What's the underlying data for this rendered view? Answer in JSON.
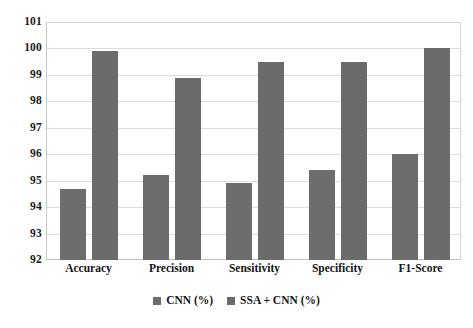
{
  "chart_data": {
    "type": "bar",
    "title": "",
    "xlabel": "",
    "ylabel": "",
    "ylim": [
      92,
      101
    ],
    "ytick_step": 1,
    "yticks": [
      101,
      100,
      99,
      98,
      97,
      96,
      95,
      94,
      93,
      92
    ],
    "ytick_labels": [
      "101",
      "100",
      "99",
      "98",
      "97",
      "96",
      "95",
      "94",
      "93",
      "92"
    ],
    "grid": true,
    "legend_position": "bottom-center",
    "categories": [
      "Accuracy",
      "Precision",
      "Sensitivity",
      "Specificity",
      "F1-Score"
    ],
    "series": [
      {
        "name": "CNN (%)",
        "color": "#6d6d6d",
        "values": [
          94.7,
          95.2,
          94.9,
          95.4,
          96.0
        ]
      },
      {
        "name": "SSA + CNN (%)",
        "color": "#6b6b6b",
        "values": [
          99.9,
          98.9,
          99.5,
          99.5,
          100.0
        ]
      }
    ],
    "legend": [
      {
        "label": "CNN (%)",
        "swatch_color": "#6d6d6d"
      },
      {
        "label": "SSA + CNN (%)",
        "swatch_color": "#6b6b6b"
      }
    ]
  }
}
